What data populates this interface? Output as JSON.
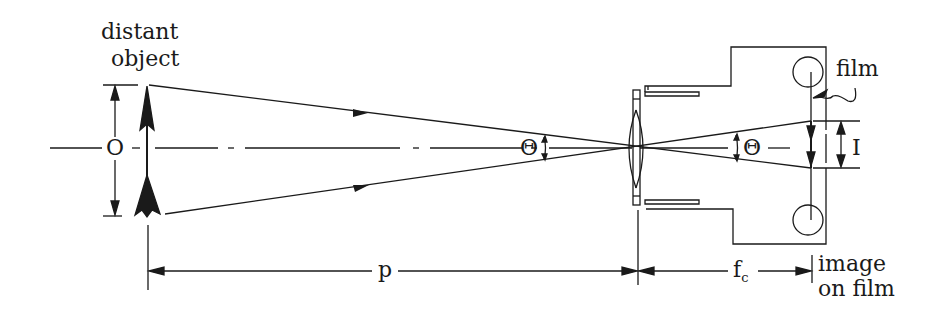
{
  "figure": {
    "labels": {
      "object_line1": "distant",
      "object_line2": "object",
      "object_size": "O",
      "angle_object_side": "Θ",
      "angle_image_side": "Θ",
      "image_size": "I",
      "film": "film",
      "distance_p": "p",
      "focal_length_base": "f",
      "focal_length_sub": "c",
      "image_line1": "image",
      "image_line2": "on film"
    },
    "colors": {
      "ink": "#1a1a1a",
      "background": "#ffffff"
    }
  }
}
